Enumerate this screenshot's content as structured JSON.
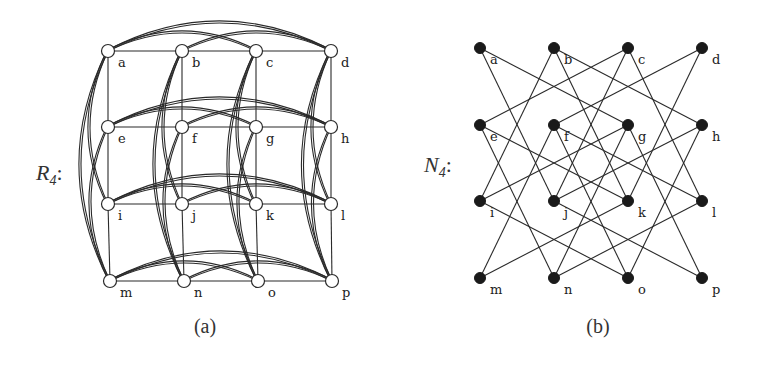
{
  "figure": {
    "panels": [
      {
        "id": "a",
        "graph_name": "R",
        "graph_subscript": "4",
        "label_suffix": ":",
        "caption": "(a)",
        "node_style": "open-circle",
        "nodes": [
          {
            "id": "a",
            "x": 108,
            "y": 51
          },
          {
            "id": "b",
            "x": 182,
            "y": 51
          },
          {
            "id": "c",
            "x": 256,
            "y": 51
          },
          {
            "id": "d",
            "x": 331,
            "y": 51
          },
          {
            "id": "e",
            "x": 108,
            "y": 127
          },
          {
            "id": "f",
            "x": 182,
            "y": 127
          },
          {
            "id": "g",
            "x": 256,
            "y": 127
          },
          {
            "id": "h",
            "x": 331,
            "y": 127
          },
          {
            "id": "i",
            "x": 108,
            "y": 204
          },
          {
            "id": "j",
            "x": 182,
            "y": 204
          },
          {
            "id": "k",
            "x": 256,
            "y": 204
          },
          {
            "id": "l",
            "x": 331,
            "y": 204
          },
          {
            "id": "m",
            "x": 110,
            "y": 281
          },
          {
            "id": "n",
            "x": 184,
            "y": 281
          },
          {
            "id": "o",
            "x": 258,
            "y": 281
          },
          {
            "id": "p",
            "x": 332,
            "y": 281
          }
        ],
        "edges": [
          [
            "a",
            "b"
          ],
          [
            "b",
            "c"
          ],
          [
            "c",
            "d"
          ],
          [
            "e",
            "f"
          ],
          [
            "f",
            "g"
          ],
          [
            "g",
            "h"
          ],
          [
            "i",
            "j"
          ],
          [
            "j",
            "k"
          ],
          [
            "k",
            "l"
          ],
          [
            "m",
            "n"
          ],
          [
            "n",
            "o"
          ],
          [
            "o",
            "p"
          ],
          [
            "a",
            "e"
          ],
          [
            "e",
            "i"
          ],
          [
            "i",
            "m"
          ],
          [
            "b",
            "f"
          ],
          [
            "f",
            "j"
          ],
          [
            "j",
            "n"
          ],
          [
            "c",
            "g"
          ],
          [
            "g",
            "k"
          ],
          [
            "k",
            "o"
          ],
          [
            "d",
            "h"
          ],
          [
            "h",
            "l"
          ],
          [
            "l",
            "p"
          ]
        ],
        "arcs": [
          [
            "a",
            "c"
          ],
          [
            "b",
            "d"
          ],
          [
            "a",
            "d"
          ],
          [
            "e",
            "g"
          ],
          [
            "f",
            "h"
          ],
          [
            "e",
            "h"
          ],
          [
            "i",
            "k"
          ],
          [
            "j",
            "l"
          ],
          [
            "i",
            "l"
          ],
          [
            "m",
            "o"
          ],
          [
            "n",
            "p"
          ],
          [
            "m",
            "p"
          ],
          [
            "a",
            "i"
          ],
          [
            "e",
            "m"
          ],
          [
            "a",
            "m"
          ],
          [
            "b",
            "j"
          ],
          [
            "f",
            "n"
          ],
          [
            "b",
            "n"
          ],
          [
            "c",
            "k"
          ],
          [
            "g",
            "o"
          ],
          [
            "c",
            "o"
          ],
          [
            "d",
            "l"
          ],
          [
            "h",
            "p"
          ],
          [
            "d",
            "p"
          ]
        ]
      },
      {
        "id": "b",
        "graph_name": "N",
        "graph_subscript": "4",
        "label_suffix": ":",
        "caption": "(b)",
        "node_style": "filled-circle",
        "nodes": [
          {
            "id": "a",
            "x": 480,
            "y": 48
          },
          {
            "id": "b",
            "x": 554,
            "y": 48
          },
          {
            "id": "c",
            "x": 628,
            "y": 48
          },
          {
            "id": "d",
            "x": 702,
            "y": 48
          },
          {
            "id": "e",
            "x": 480,
            "y": 125
          },
          {
            "id": "f",
            "x": 554,
            "y": 125
          },
          {
            "id": "g",
            "x": 628,
            "y": 125
          },
          {
            "id": "h",
            "x": 702,
            "y": 125
          },
          {
            "id": "i",
            "x": 480,
            "y": 201
          },
          {
            "id": "j",
            "x": 554,
            "y": 201
          },
          {
            "id": "k",
            "x": 628,
            "y": 201
          },
          {
            "id": "l",
            "x": 702,
            "y": 201
          },
          {
            "id": "m",
            "x": 480,
            "y": 278
          },
          {
            "id": "n",
            "x": 554,
            "y": 278
          },
          {
            "id": "o",
            "x": 628,
            "y": 278
          },
          {
            "id": "p",
            "x": 702,
            "y": 278
          }
        ],
        "edges": [
          [
            "a",
            "g"
          ],
          [
            "a",
            "j"
          ],
          [
            "b",
            "h"
          ],
          [
            "b",
            "i"
          ],
          [
            "b",
            "k"
          ],
          [
            "c",
            "e"
          ],
          [
            "c",
            "j"
          ],
          [
            "c",
            "l"
          ],
          [
            "d",
            "f"
          ],
          [
            "d",
            "k"
          ],
          [
            "e",
            "k"
          ],
          [
            "e",
            "n"
          ],
          [
            "f",
            "l"
          ],
          [
            "f",
            "m"
          ],
          [
            "f",
            "o"
          ],
          [
            "g",
            "i"
          ],
          [
            "g",
            "n"
          ],
          [
            "g",
            "p"
          ],
          [
            "h",
            "j"
          ],
          [
            "h",
            "o"
          ],
          [
            "i",
            "o"
          ],
          [
            "j",
            "p"
          ],
          [
            "k",
            "m"
          ],
          [
            "l",
            "n"
          ]
        ]
      }
    ]
  }
}
